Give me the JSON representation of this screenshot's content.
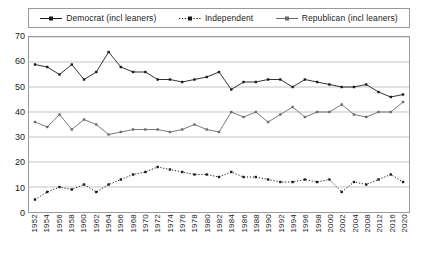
{
  "chart_data": {
    "type": "line",
    "title": "",
    "xlabel": "",
    "ylabel": "",
    "ylim": [
      0,
      70
    ],
    "ytick_step": 10,
    "grid": true,
    "legend_position": "top",
    "yticks": [
      "70",
      "60",
      "50",
      "40",
      "30",
      "20",
      "10",
      "0"
    ],
    "categories": [
      "1952",
      "1954",
      "1956",
      "1958",
      "1960",
      "1962",
      "1964",
      "1966",
      "1968",
      "1970",
      "1972",
      "1974",
      "1976",
      "1978",
      "1980",
      "1982",
      "1984",
      "1986",
      "1988",
      "1990",
      "1992",
      "1994",
      "1996",
      "1998",
      "2000",
      "2002",
      "2004",
      "2008",
      "2012",
      "2016",
      "2020"
    ],
    "series": [
      {
        "name": "Democrat  (incl leaners)",
        "marker": "filled-square",
        "line_style": "solid",
        "color": "#1a1a1a",
        "values": [
          59,
          58,
          55,
          59,
          53,
          56,
          64,
          58,
          56,
          56,
          53,
          53,
          52,
          53,
          54,
          56,
          49,
          52,
          52,
          53,
          53,
          50,
          53,
          52,
          51,
          50,
          50,
          51,
          48,
          46,
          47
        ]
      },
      {
        "name": "Independent",
        "marker": "filled-square",
        "line_style": "dotted",
        "color": "#1a1a1a",
        "values": [
          5,
          8,
          10,
          9,
          11,
          8,
          11,
          13,
          15,
          16,
          18,
          17,
          16,
          15,
          15,
          14,
          16,
          14,
          14,
          13,
          12,
          12,
          13,
          12,
          13,
          8,
          12,
          11,
          13,
          15,
          12
        ]
      },
      {
        "name": "Republican  (incl leaners)",
        "marker": "filled-square",
        "line_style": "solid",
        "color": "#6a6a6a",
        "values": [
          36,
          34,
          39,
          33,
          37,
          35,
          31,
          32,
          33,
          33,
          33,
          32,
          33,
          35,
          33,
          32,
          40,
          38,
          40,
          36,
          39,
          42,
          38,
          40,
          40,
          43,
          39,
          38,
          40,
          40,
          44
        ]
      }
    ]
  }
}
